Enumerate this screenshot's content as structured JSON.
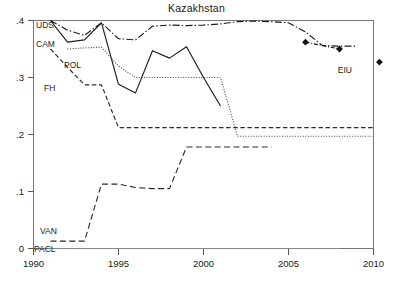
{
  "chart_data": {
    "type": "line",
    "title": "Kazakhstan",
    "xlabel": "",
    "ylabel": "",
    "xlim": [
      1990,
      2010
    ],
    "ylim": [
      0,
      0.4
    ],
    "grid": false,
    "legend_position": "inline-labels",
    "xticks": [
      "1990",
      "1995",
      "2000",
      "2005",
      "2010"
    ],
    "xtick_values": [
      1990,
      1995,
      2000,
      2005,
      2010
    ],
    "yticks": [
      "0",
      ".1",
      ".2",
      ".3",
      ".4"
    ],
    "ytick_values": [
      0,
      0.1,
      0.2,
      0.3,
      0.4
    ],
    "series": [
      {
        "name": "UDS",
        "label": "UDS",
        "style": "dash-dot",
        "color": "#1b1b1b",
        "x": [
          1991,
          1992,
          1993,
          1994,
          1995,
          1996,
          1997,
          1998,
          1999,
          2000,
          2001,
          2002,
          2003,
          2004,
          2005,
          2006,
          2007,
          2008,
          2009
        ],
        "values": [
          0.4,
          0.383,
          0.374,
          0.396,
          0.368,
          0.366,
          0.39,
          0.392,
          0.391,
          0.392,
          0.394,
          0.398,
          0.399,
          0.398,
          0.396,
          0.38,
          0.356,
          0.355,
          0.355
        ]
      },
      {
        "name": "CAM",
        "label": "CAM",
        "style": "solid",
        "color": "#1b1b1b",
        "x": [
          1991,
          1992,
          1993,
          1994,
          1995,
          1996,
          1997,
          1998,
          1999,
          2000,
          2001
        ],
        "values": [
          0.4,
          0.362,
          0.366,
          0.396,
          0.288,
          0.273,
          0.347,
          0.334,
          0.354,
          0.3,
          0.25
        ]
      },
      {
        "name": "POL",
        "label": "POL",
        "style": "dotted",
        "color": "#4a4a4a",
        "x": [
          1992,
          1993,
          1994,
          1995,
          1996,
          1997,
          1998,
          1999,
          2000,
          2001,
          2002,
          2003,
          2004,
          2005,
          2006,
          2007,
          2008,
          2009,
          2010
        ],
        "values": [
          0.35,
          0.352,
          0.353,
          0.32,
          0.3,
          0.3,
          0.3,
          0.3,
          0.3,
          0.3,
          0.197,
          0.197,
          0.197,
          0.197,
          0.197,
          0.197,
          0.197,
          0.197,
          0.197
        ]
      },
      {
        "name": "FH",
        "label": "FH",
        "style": "dashed",
        "color": "#2a2a2a",
        "x": [
          1991,
          1992,
          1993,
          1994,
          1995,
          1996,
          1997,
          1998,
          1999,
          2000,
          2001,
          2002,
          2003,
          2004,
          2005,
          2006,
          2007,
          2008,
          2009,
          2010
        ],
        "values": [
          0.35,
          0.318,
          0.287,
          0.287,
          0.212,
          0.212,
          0.212,
          0.212,
          0.212,
          0.212,
          0.212,
          0.212,
          0.212,
          0.212,
          0.212,
          0.212,
          0.212,
          0.212,
          0.212,
          0.212
        ]
      },
      {
        "name": "VAN",
        "label": "VAN",
        "style": "long-dash",
        "color": "#2a2a2a",
        "x": [
          1991,
          1992,
          1993,
          1994,
          1995,
          1996,
          1997,
          1998,
          1999,
          2000,
          2001,
          2002,
          2003,
          2004
        ],
        "values": [
          0.013,
          0.013,
          0.013,
          0.113,
          0.113,
          0.107,
          0.105,
          0.105,
          0.178,
          0.178,
          0.178,
          0.178,
          0.178,
          0.178
        ]
      },
      {
        "name": "PACL",
        "label": "PACL",
        "style": "solid-thin",
        "color": "#8a8a8a",
        "x": [
          1991,
          2008
        ],
        "values": [
          0.0,
          0.0
        ]
      },
      {
        "name": "EIU",
        "label": "EIU",
        "style": "markers-dashdot",
        "color": "#111111",
        "marker": "diamond",
        "x": [
          2006,
          2008
        ],
        "values": [
          0.362,
          0.35
        ],
        "legend_marker_value": 0.327,
        "legend_marker_x": 2010.35
      }
    ]
  },
  "labels": {
    "uds": "UDS",
    "cam": "CAM",
    "pol": "POL",
    "fh": "FH",
    "van": "VAN",
    "pacl": "PACL",
    "eiu": "EIU"
  },
  "axis": {
    "y": {
      "t0": "0",
      "t1": ".1",
      "t2": ".2",
      "t3": ".3",
      "t4": ".4"
    },
    "x": {
      "t0": "1990",
      "t1": "1995",
      "t2": "2000",
      "t3": "2005",
      "t4": "2010"
    }
  }
}
